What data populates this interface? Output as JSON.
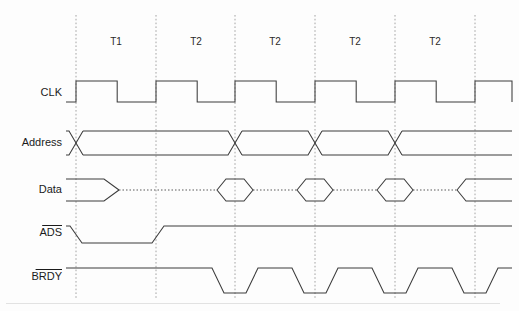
{
  "figure": {
    "kind": "digital-timing-diagram",
    "title": "",
    "width": 519,
    "height": 311,
    "background_color": "#fdfdfd",
    "wave_color": "#3c3c3c",
    "grid_color": "#9a9a9a",
    "label_color": "#1b1b1b"
  },
  "geometry": {
    "clock_edges_x": [
      76,
      156,
      235,
      315,
      395,
      475
    ],
    "grid_top_y": 15,
    "grid_bottom_y": 300,
    "signal_start_x": 66,
    "signal_end_x": 512,
    "period_px": 80
  },
  "phases": {
    "label_y": 42,
    "items": [
      {
        "label": "T1",
        "center_x": 116
      },
      {
        "label": "T2",
        "center_x": 196
      },
      {
        "label": "T2",
        "center_x": 275
      },
      {
        "label": "T2",
        "center_x": 355
      },
      {
        "label": "T2",
        "center_x": 435
      }
    ]
  },
  "signals": [
    {
      "name": "CLK",
      "label": "CLK",
      "overbar": false,
      "label_x": 62,
      "label_y": 93,
      "high_y": 81,
      "low_y": 102,
      "type": "clock"
    },
    {
      "name": "Address",
      "label": "Address",
      "overbar": false,
      "label_x": 62,
      "label_y": 143,
      "high_y": 131,
      "low_y": 155,
      "type": "bus",
      "transitions_x": [
        76,
        235,
        315,
        395
      ],
      "valid_segments": [
        "A1",
        "A2",
        "A3",
        "A4",
        "A5"
      ]
    },
    {
      "name": "Data",
      "label": "Data",
      "overbar": false,
      "label_x": 62,
      "label_y": 190,
      "high_y": 179,
      "low_y": 201,
      "type": "data-bus",
      "hiz_level_y": 190,
      "first_segment_end_x": 76,
      "valid_centers_x": [
        235,
        315,
        395
      ],
      "valid_half_width": 18,
      "last_segment_start_x": 475
    },
    {
      "name": "ADS",
      "label": "ADS",
      "overbar": true,
      "label_x": 62,
      "label_y": 233,
      "high_y": 226,
      "low_y": 243,
      "type": "strobe-active-low",
      "fall_start_x": 70,
      "fall_end_x": 82,
      "rise_start_x": 152,
      "rise_end_x": 164
    },
    {
      "name": "BRDY",
      "label": "BRDY",
      "overbar": true,
      "label_x": 62,
      "label_y": 277,
      "high_y": 268,
      "low_y": 293,
      "type": "handshake-active-low",
      "pulse_centers_x": [
        235,
        315,
        395,
        475
      ],
      "pulse_half_flat": 11,
      "pulse_slope": 12
    }
  ]
}
